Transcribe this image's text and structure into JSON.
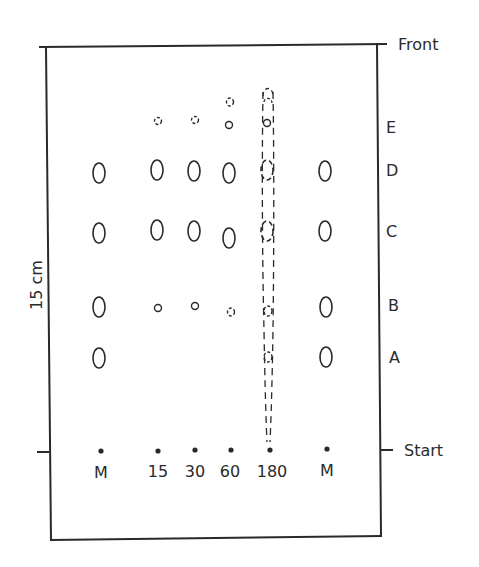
{
  "diagram": {
    "type": "thin-layer chromatogram",
    "labels": {
      "front": "Front",
      "start": "Start",
      "scale": "15 cm"
    },
    "lanes": [
      {
        "id": "M-left",
        "label": "M",
        "x": 100
      },
      {
        "id": "15",
        "label": "15",
        "x": 158
      },
      {
        "id": "30",
        "label": "30",
        "x": 195
      },
      {
        "id": "60",
        "label": "60",
        "x": 231
      },
      {
        "id": "180",
        "label": "180",
        "x": 268
      },
      {
        "id": "M-right",
        "label": "M",
        "x": 327
      }
    ],
    "bands": [
      {
        "label": "E",
        "y": 127
      },
      {
        "label": "D",
        "y": 170
      },
      {
        "label": "C",
        "y": 231
      },
      {
        "label": "B",
        "y": 305
      },
      {
        "label": "A",
        "y": 357
      }
    ],
    "spots": [
      {
        "lane": "M-left",
        "band": "D",
        "x": 99,
        "y": 173,
        "rx": 6,
        "ry": 10,
        "style": "solid"
      },
      {
        "lane": "M-left",
        "band": "C",
        "x": 99,
        "y": 233,
        "rx": 6,
        "ry": 10,
        "style": "solid"
      },
      {
        "lane": "M-left",
        "band": "B",
        "x": 99,
        "y": 307,
        "rx": 6,
        "ry": 10,
        "style": "solid"
      },
      {
        "lane": "M-left",
        "band": "A",
        "x": 99,
        "y": 358,
        "rx": 6,
        "ry": 10,
        "style": "solid"
      },
      {
        "lane": "15",
        "band": "E",
        "x": 158,
        "y": 121,
        "rx": 3.5,
        "ry": 3.5,
        "style": "dashed"
      },
      {
        "lane": "15",
        "band": "D",
        "x": 157,
        "y": 170,
        "rx": 6,
        "ry": 10,
        "style": "solid"
      },
      {
        "lane": "15",
        "band": "C",
        "x": 157,
        "y": 230,
        "rx": 6,
        "ry": 10,
        "style": "solid"
      },
      {
        "lane": "15",
        "band": "B",
        "x": 158,
        "y": 308,
        "rx": 3.5,
        "ry": 3.5,
        "style": "solid"
      },
      {
        "lane": "30",
        "band": "E",
        "x": 195,
        "y": 120,
        "rx": 3.5,
        "ry": 3.5,
        "style": "dashed"
      },
      {
        "lane": "30",
        "band": "D",
        "x": 194,
        "y": 171,
        "rx": 6,
        "ry": 10,
        "style": "solid"
      },
      {
        "lane": "30",
        "band": "C",
        "x": 194,
        "y": 231,
        "rx": 6,
        "ry": 10,
        "style": "solid"
      },
      {
        "lane": "30",
        "band": "B",
        "x": 195,
        "y": 306,
        "rx": 3.5,
        "ry": 3.5,
        "style": "solid"
      },
      {
        "lane": "60",
        "band": "above-E",
        "x": 230,
        "y": 102,
        "rx": 3.5,
        "ry": 4,
        "style": "dashed"
      },
      {
        "lane": "60",
        "band": "E",
        "x": 229,
        "y": 125,
        "rx": 3.5,
        "ry": 3.5,
        "style": "solid"
      },
      {
        "lane": "60",
        "band": "D",
        "x": 229,
        "y": 173,
        "rx": 6,
        "ry": 10,
        "style": "solid"
      },
      {
        "lane": "60",
        "band": "C",
        "x": 229,
        "y": 238,
        "rx": 6,
        "ry": 10,
        "style": "solid"
      },
      {
        "lane": "60",
        "band": "B",
        "x": 231,
        "y": 312,
        "rx": 3.5,
        "ry": 4,
        "style": "dashed"
      },
      {
        "lane": "180",
        "band": "E",
        "x": 267,
        "y": 123,
        "rx": 3.5,
        "ry": 3.5,
        "style": "solid"
      },
      {
        "lane": "180",
        "band": "D",
        "x": 267,
        "y": 170,
        "rx": 6,
        "ry": 10,
        "style": "dashed"
      },
      {
        "lane": "180",
        "band": "C",
        "x": 267,
        "y": 231,
        "rx": 6,
        "ry": 10,
        "style": "dashed"
      },
      {
        "lane": "180",
        "band": "B",
        "x": 268,
        "y": 311,
        "rx": 4,
        "ry": 5,
        "style": "dashed"
      },
      {
        "lane": "180",
        "band": "A",
        "x": 268,
        "y": 357,
        "rx": 4,
        "ry": 5,
        "style": "dashed"
      },
      {
        "lane": "M-right",
        "band": "D",
        "x": 325,
        "y": 171,
        "rx": 6,
        "ry": 10,
        "style": "solid"
      },
      {
        "lane": "M-right",
        "band": "C",
        "x": 325,
        "y": 231,
        "rx": 6,
        "ry": 10,
        "style": "solid"
      },
      {
        "lane": "M-right",
        "band": "B",
        "x": 326,
        "y": 307,
        "rx": 6,
        "ry": 10,
        "style": "solid"
      },
      {
        "lane": "M-right",
        "band": "A",
        "x": 326,
        "y": 357,
        "rx": 6,
        "ry": 10,
        "style": "solid"
      }
    ],
    "streak": {
      "lane": "180",
      "x": 268,
      "top_y": 88,
      "bottom_y": 442,
      "style": "dashed"
    },
    "colors": {
      "ink": "#2a2a2a",
      "background": "#ffffff"
    }
  }
}
